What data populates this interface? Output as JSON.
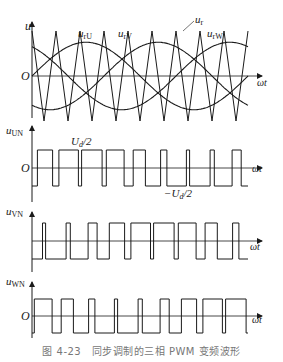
{
  "figure": {
    "caption": "图 4-23　同步调制的三相 PWM 变频波形",
    "colors": {
      "ink": "#1a1a1a",
      "caption": "#777777",
      "background": "#ffffff"
    }
  },
  "panels": {
    "reference": {
      "y_label": "u",
      "origin_label": "O",
      "x_label": "ωt",
      "curve_labels": [
        "u_rU",
        "u_rV",
        "u_rW"
      ],
      "carrier_label": "u_r"
    },
    "uUN": {
      "y_label": "u_UN",
      "origin_label": "O",
      "x_label": "ωt",
      "pos_level_label": "U_d/2",
      "neg_level_label": "−U_d/2"
    },
    "uVN": {
      "y_label": "u_VN",
      "x_label": "ωt"
    },
    "uWN": {
      "y_label": "u_WN",
      "origin_label": "O",
      "x_label": "ωt"
    }
  },
  "chart_data": {
    "type": "line",
    "title": "同步调制的三相 PWM 变频波形",
    "carrier": {
      "name": "u_r",
      "shape": "triangle",
      "periods_per_fundamental": 9,
      "amplitude": 1.0
    },
    "references": [
      {
        "name": "u_rU",
        "phase_deg": 0,
        "amplitude": 0.75
      },
      {
        "name": "u_rV",
        "phase_deg": -120,
        "amplitude": 0.75
      },
      {
        "name": "u_rW",
        "phase_deg": 120,
        "amplitude": 0.75
      }
    ],
    "outputs": [
      {
        "name": "u_UN",
        "levels": [
          "U_d/2",
          "-U_d/2"
        ]
      },
      {
        "name": "u_VN",
        "levels": [
          "U_d/2",
          "-U_d/2"
        ]
      },
      {
        "name": "u_WN",
        "levels": [
          "U_d/2",
          "-U_d/2"
        ]
      }
    ],
    "xlabel": "ωt",
    "fundamental_periods_shown": 1.0
  }
}
